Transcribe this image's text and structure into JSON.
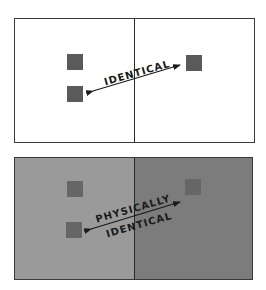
{
  "panels": [
    {
      "name": "top",
      "label": "IDENTICAL",
      "left_background": "#ffffff",
      "right_background": "#ffffff",
      "square_color": "#5a5a5a"
    },
    {
      "name": "bottom",
      "label_line1": "PHYSICALLY",
      "label_line2": "IDENTICAL",
      "left_background": "#9a9a9a",
      "right_background": "#7c7c7c",
      "square_color": "#666666"
    }
  ]
}
